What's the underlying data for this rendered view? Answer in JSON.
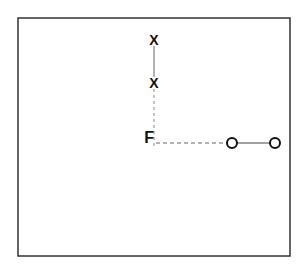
{
  "diagram": {
    "frame": {
      "x": 18,
      "y": 18,
      "width": 272,
      "height": 238,
      "stroke": "#333333"
    },
    "origin_label": {
      "text": "F",
      "x": 154,
      "y": 138
    },
    "vertical_arm": {
      "markers": [
        {
          "symbol": "X",
          "x": 154,
          "y": 40
        },
        {
          "symbol": "X",
          "x": 154,
          "y": 83
        }
      ],
      "solid_segment": {
        "x1": 154,
        "y1": 46,
        "x2": 154,
        "y2": 77
      },
      "dashed_segment": {
        "x1": 154,
        "y1": 89,
        "x2": 154,
        "y2": 147
      }
    },
    "horizontal_arm": {
      "markers": [
        {
          "symbol": "O",
          "cx": 232,
          "cy": 143,
          "r": 5
        },
        {
          "symbol": "O",
          "cx": 275,
          "cy": 143,
          "r": 5
        }
      ],
      "dashed_segment": {
        "x1": 156,
        "y1": 143,
        "x2": 227,
        "y2": 143
      },
      "solid_segment": {
        "x1": 237,
        "y1": 143,
        "x2": 270,
        "y2": 143
      }
    },
    "colors": {
      "line": "#555555",
      "marker": "#111111",
      "background": "#ffffff"
    }
  }
}
